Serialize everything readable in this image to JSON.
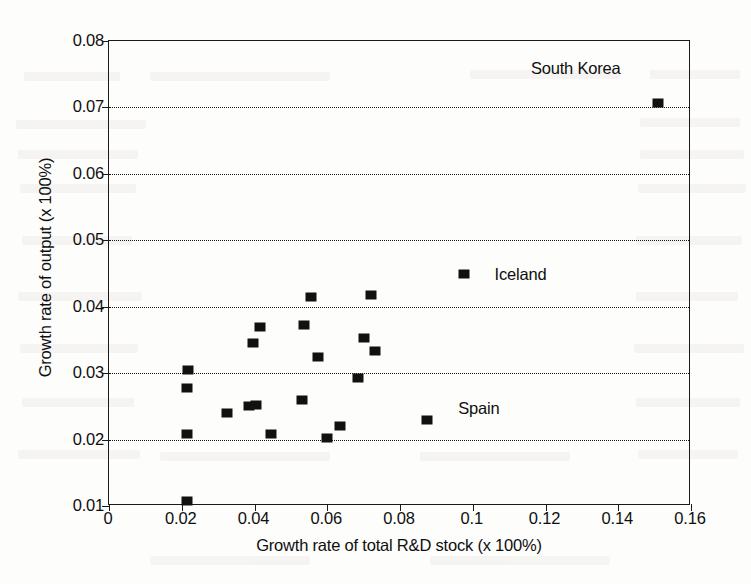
{
  "chart_data": {
    "type": "scatter",
    "title": "",
    "xlabel": "Growth rate of total R&D stock (x 100%)",
    "ylabel": "Growth rate of output (x 100%)",
    "xlim": [
      0,
      0.16
    ],
    "ylim": [
      0.01,
      0.08
    ],
    "xticks": [
      0,
      0.02,
      0.04,
      0.06,
      0.08,
      0.1,
      0.12,
      0.14,
      0.16
    ],
    "xtick_labels": [
      "0",
      "0.02",
      "0.04",
      "0.06",
      "0.08",
      "0.1",
      "0.12",
      "0.14",
      "0.16"
    ],
    "yticks": [
      0.01,
      0.02,
      0.03,
      0.04,
      0.05,
      0.06,
      0.07,
      0.08
    ],
    "ytick_labels": [
      "0.01",
      "0.02",
      "0.03",
      "0.04",
      "0.05",
      "0.06",
      "0.07",
      "0.08"
    ],
    "gridlines": {
      "horizontal": [
        0.02,
        0.03,
        0.04,
        0.05,
        0.06,
        0.07
      ],
      "style": "dotted",
      "vertical": []
    },
    "legend": "none",
    "marker": {
      "shape": "square",
      "color": "#111111",
      "size_px": 10
    },
    "points": [
      {
        "x": 0.0215,
        "y": 0.0108
      },
      {
        "x": 0.0215,
        "y": 0.0208
      },
      {
        "x": 0.0215,
        "y": 0.0278
      },
      {
        "x": 0.0218,
        "y": 0.0305
      },
      {
        "x": 0.0325,
        "y": 0.024
      },
      {
        "x": 0.0385,
        "y": 0.025
      },
      {
        "x": 0.0395,
        "y": 0.0345
      },
      {
        "x": 0.0405,
        "y": 0.0252
      },
      {
        "x": 0.0415,
        "y": 0.037
      },
      {
        "x": 0.0445,
        "y": 0.0208
      },
      {
        "x": 0.053,
        "y": 0.026
      },
      {
        "x": 0.0535,
        "y": 0.0373
      },
      {
        "x": 0.0555,
        "y": 0.0415
      },
      {
        "x": 0.06,
        "y": 0.0202
      },
      {
        "x": 0.0575,
        "y": 0.0325
      },
      {
        "x": 0.0635,
        "y": 0.022
      },
      {
        "x": 0.0685,
        "y": 0.0292
      },
      {
        "x": 0.07,
        "y": 0.0353
      },
      {
        "x": 0.072,
        "y": 0.0418
      },
      {
        "x": 0.073,
        "y": 0.0333
      },
      {
        "x": 0.0875,
        "y": 0.023
      },
      {
        "x": 0.0975,
        "y": 0.045
      },
      {
        "x": 0.151,
        "y": 0.0707
      }
    ],
    "annotations": [
      {
        "label": "South Korea",
        "point_x": 0.151,
        "point_y": 0.0707,
        "text_x": 0.116,
        "text_y": 0.076
      },
      {
        "label": "Iceland",
        "point_x": 0.0975,
        "point_y": 0.045,
        "text_x": 0.106,
        "text_y": 0.045
      },
      {
        "label": "Spain",
        "point_x": 0.0875,
        "point_y": 0.023,
        "text_x": 0.096,
        "text_y": 0.0248
      }
    ]
  }
}
